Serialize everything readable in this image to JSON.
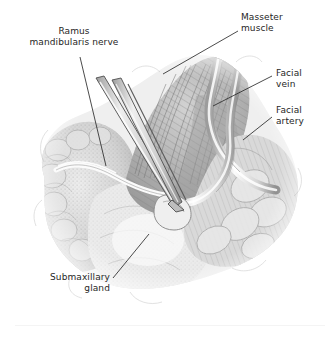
{
  "figure": {
    "kind": "anatomical-surgical-illustration",
    "medium": "pencil / graphite halftone drawing",
    "background_color": "#ffffff",
    "ink_color": "#262626",
    "tissue_tone_light": "#f0f0f0",
    "tissue_tone_mid": "#c9c9c9",
    "tissue_tone_dark": "#8a8a8a",
    "instrument_tone": "#d8d8d8"
  },
  "labels": [
    {
      "id": "ramus-mandibularis-nerve",
      "text": "Ramus\nmandibularis nerve",
      "align": "center",
      "position": "top-left",
      "leader_from": [
        80,
        57
      ],
      "leader_to": [
        106,
        166
      ]
    },
    {
      "id": "masseter-muscle",
      "text": "Masseter\nmuscle",
      "align": "left",
      "position": "top-right",
      "leader_from": [
        238,
        31
      ],
      "leader_to": [
        163,
        74
      ]
    },
    {
      "id": "facial-vein",
      "text": "Facial\nvein",
      "align": "left",
      "position": "right",
      "leader_from": [
        272,
        76
      ],
      "leader_to": [
        213,
        106
      ]
    },
    {
      "id": "facial-artery",
      "text": "Facial\nartery",
      "align": "left",
      "position": "right",
      "leader_from": [
        272,
        117
      ],
      "leader_to": [
        243,
        140
      ]
    },
    {
      "id": "submaxillary-gland",
      "text": "Submaxillary\ngland",
      "align": "right",
      "position": "bottom-left",
      "leader_from": [
        113,
        278
      ],
      "leader_to": [
        149,
        234
      ]
    }
  ],
  "structures": [
    {
      "id": "masseter-muscle",
      "note": "fan of diagonal striations, upper centre-right"
    },
    {
      "id": "facial-vein",
      "note": "anterior wavy vessel descending at right"
    },
    {
      "id": "facial-artery",
      "note": "posterior wavy vessel, curves left toward forceps tip"
    },
    {
      "id": "ramus-mandibularis-nerve",
      "note": "pale slender nerve crossing left of centre"
    },
    {
      "id": "submaxillary-gland",
      "note": "lobulated gland filling left and lower field"
    },
    {
      "id": "forceps",
      "note": "two-bladed forceps entering from upper left, tip grasping at centre"
    }
  ]
}
